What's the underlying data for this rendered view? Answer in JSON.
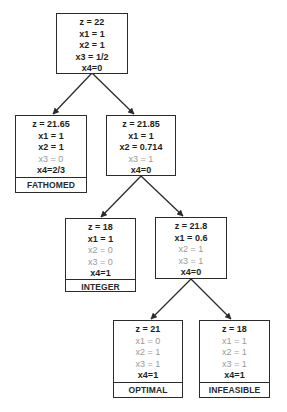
{
  "colors": {
    "edge": "#2b2b2b",
    "active_text": "#1e1e1e",
    "fixed_text": "#9a9a9a",
    "border": "#2b2b2b"
  },
  "nodes": {
    "root": {
      "lines": [
        {
          "text": "z = 22",
          "dim": false
        },
        {
          "text": "x1 = 1",
          "dim": false
        },
        {
          "text": "x2 = 1",
          "dim": false
        },
        {
          "text": "x3 = 1/2",
          "dim": false
        },
        {
          "text": "x4=0",
          "dim": false
        }
      ]
    },
    "left": {
      "lines": [
        {
          "text": "z = 21.65",
          "dim": false
        },
        {
          "text": "x1 = 1",
          "dim": false
        },
        {
          "text": "x2 = 1",
          "dim": false
        },
        {
          "text": "x3 = 0",
          "dim": true
        },
        {
          "text": "x4=2/3",
          "dim": false
        }
      ],
      "status": "FATHOMED"
    },
    "right": {
      "lines": [
        {
          "text": "z = 21.85",
          "dim": false
        },
        {
          "text": "x1 = 1",
          "dim": false
        },
        {
          "text": "x2 = 0.714",
          "dim": false
        },
        {
          "text": "x3 = 1",
          "dim": true
        },
        {
          "text": "x4=0",
          "dim": false
        }
      ]
    },
    "integer": {
      "lines": [
        {
          "text": "z = 18",
          "dim": false
        },
        {
          "text": "x1 = 1",
          "dim": false
        },
        {
          "text": "x2 = 0",
          "dim": true
        },
        {
          "text": "x3 = 0",
          "dim": true
        },
        {
          "text": "x4=1",
          "dim": false
        }
      ],
      "status": "INTEGER"
    },
    "mid": {
      "lines": [
        {
          "text": "z = 21.8",
          "dim": false
        },
        {
          "text": "x1 = 0.6",
          "dim": false
        },
        {
          "text": "x2 = 1",
          "dim": true
        },
        {
          "text": "x3 = 1",
          "dim": true
        },
        {
          "text": "x4=0",
          "dim": false
        }
      ]
    },
    "optimal": {
      "lines": [
        {
          "text": "z = 21",
          "dim": false
        },
        {
          "text": "x1 = 0",
          "dim": true
        },
        {
          "text": "x2 = 1",
          "dim": true
        },
        {
          "text": "x3 = 1",
          "dim": true
        },
        {
          "text": "x4=1",
          "dim": false
        }
      ],
      "status": "OPTIMAL"
    },
    "infeasible": {
      "lines": [
        {
          "text": "z = 18",
          "dim": false
        },
        {
          "text": "x1 = 1",
          "dim": true
        },
        {
          "text": "x2 = 1",
          "dim": true
        },
        {
          "text": "x3 = 1",
          "dim": true
        },
        {
          "text": "x4=1",
          "dim": false
        }
      ],
      "status": "INFEASIBLE"
    }
  }
}
